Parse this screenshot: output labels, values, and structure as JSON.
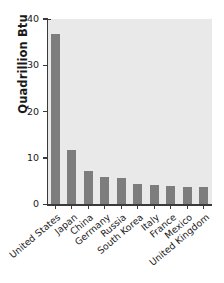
{
  "chart_data": {
    "type": "bar",
    "title": "",
    "subtitle": "",
    "xlabel": "",
    "ylabel": "Quadrillion Btu",
    "categories": [
      "United States",
      "Japan",
      "China",
      "Germany",
      "Russia",
      "South Korea",
      "Italy",
      "France",
      "Mexico",
      "United Kingdom"
    ],
    "values": [
      36.7,
      11.7,
      7.1,
      6.0,
      5.7,
      4.4,
      4.2,
      4.0,
      3.7,
      3.8
    ],
    "ylim": [
      0,
      40
    ],
    "yticks": [
      0,
      10,
      20,
      30,
      40
    ],
    "ytick_labels": [
      "0",
      "10",
      "20",
      "30",
      "40"
    ],
    "grid": false,
    "legend": null,
    "legend_position": "none",
    "bar_color": "#7d7d7d",
    "plot_background": "#e9e9e9",
    "axis_color": "#3a3a3a",
    "page_background": "#ffffff"
  }
}
